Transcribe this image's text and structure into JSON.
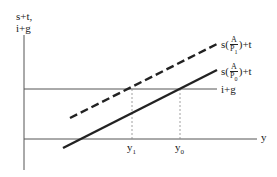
{
  "diagram": {
    "y_axis_label_line1": "s+t,",
    "y_axis_label_line2": "i+g",
    "x_axis_label": "y",
    "horizontal_line_label": "i+g",
    "upper_curve": {
      "prefix": "s(",
      "num": "A",
      "den": "P",
      "den_sub": "1",
      "suffix": ")+t",
      "style": "dashed"
    },
    "lower_curve": {
      "prefix": "s(",
      "num": "A",
      "den": "P",
      "den_sub": "0",
      "suffix": ")+t",
      "style": "solid"
    },
    "tick_y1": "y",
    "tick_y1_sub": "1",
    "tick_y0": "y",
    "tick_y0_sub": "0",
    "colors": {
      "line": "#222222",
      "axis": "#555555",
      "guide": "#888888"
    }
  }
}
